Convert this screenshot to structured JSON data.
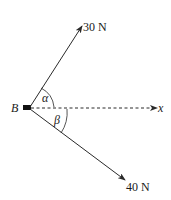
{
  "diagram": {
    "point_label": "B",
    "force1": {
      "label": "30 N",
      "angle_label": "α"
    },
    "force2": {
      "label": "40 N",
      "angle_label": "β"
    },
    "axis_label": "x",
    "colors": {
      "line": "#2a2a2a",
      "block": "#111111"
    }
  }
}
